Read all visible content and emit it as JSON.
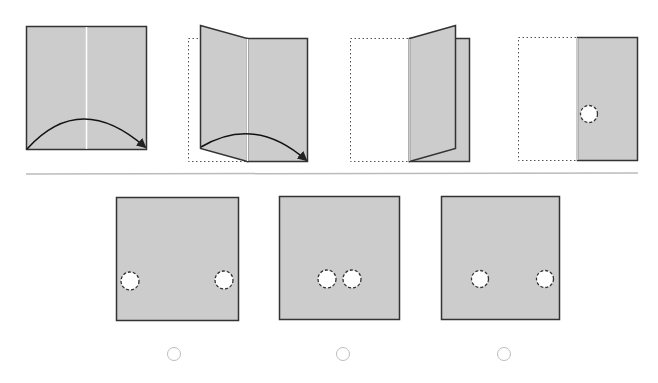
{
  "puzzle": {
    "type": "paper-folding-hole-punch",
    "colors": {
      "paper": "#cccccc",
      "outline": "#333333",
      "crease": "#ffffff",
      "divider": "#bbbbbb",
      "radio_border": "#bdbdbd"
    },
    "steps": [
      {
        "name": "step-1-unfolded-paper",
        "description": "Square sheet with vertical center crease; arrow shows left half folding over to the right"
      },
      {
        "name": "step-2-folding-in-progress",
        "description": "Left half lifting toward right along center crease"
      },
      {
        "name": "step-3-nearly-folded",
        "description": "Left half almost folded onto right half"
      },
      {
        "name": "step-4-folded-punched",
        "description": "Folded paper with one hole punched near left fold edge"
      }
    ],
    "options": [
      {
        "id": "A",
        "holes": 2,
        "hole_positions": "left edge and right edge, lower third"
      },
      {
        "id": "B",
        "holes": 2,
        "hole_positions": "two adjacent holes near center, lower third"
      },
      {
        "id": "C",
        "holes": 2,
        "hole_positions": "left-center and right edge, lower third"
      }
    ],
    "selected_option": null
  }
}
